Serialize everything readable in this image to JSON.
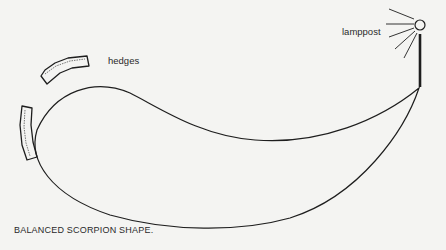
{
  "diagram": {
    "labels": {
      "hedges": "hedges",
      "lamppost": "lamppost"
    },
    "caption": "BALANCED SCORPION SHAPE.",
    "elements": [
      {
        "name": "scorpion-shape-outline",
        "type": "closed-curve"
      },
      {
        "name": "hedge-top",
        "type": "hedge"
      },
      {
        "name": "hedge-left",
        "type": "hedge"
      },
      {
        "name": "lamppost",
        "type": "lamp-with-rays"
      }
    ],
    "colors": {
      "background": "#f4f4f2",
      "ink": "#1e1e1e"
    }
  }
}
